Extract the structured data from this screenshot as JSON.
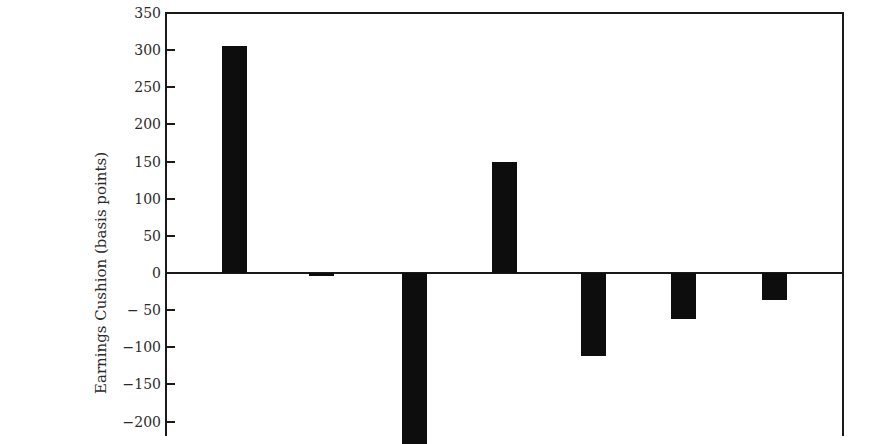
{
  "chart_data": {
    "type": "bar",
    "title": "",
    "xlabel": "",
    "ylabel": "Earnings Cushion (basis points)",
    "ylim": [
      -220,
      350
    ],
    "yticks": [
      350,
      300,
      250,
      200,
      150,
      100,
      50,
      0,
      -50,
      -100,
      -150,
      -200
    ],
    "ytick_labels": [
      "350",
      "300",
      "250",
      "200",
      "150",
      "100",
      "50",
      "0",
      "− 50",
      "−100",
      "−150",
      "−200"
    ],
    "categories": [
      "1",
      "2",
      "3",
      "4",
      "5",
      "6",
      "7"
    ],
    "values": [
      305,
      -4,
      -230,
      150,
      -112,
      -62,
      -37
    ],
    "grid": false,
    "legend": null,
    "bar_color": "#0d0d0d"
  },
  "layout": {
    "plot_left": 166,
    "plot_right": 843,
    "plot_top": 13,
    "zero_y": 273,
    "px_per_unit": 0.743,
    "bar_width": 25,
    "bar_centers": [
      234,
      321,
      414,
      504,
      593,
      683,
      774
    ]
  }
}
